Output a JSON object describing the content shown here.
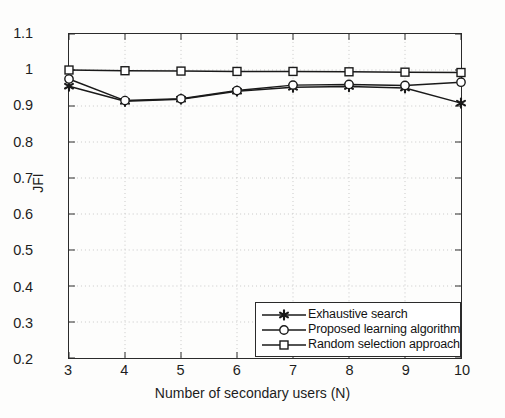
{
  "chart_data": {
    "type": "line",
    "title": "",
    "xlabel": "Number of secondary users (N)",
    "ylabel": "JFI",
    "x": [
      3,
      4,
      5,
      6,
      7,
      8,
      9,
      10
    ],
    "xlim": [
      3,
      10
    ],
    "ylim": [
      0.2,
      1.1
    ],
    "xticks": [
      "3",
      "4",
      "5",
      "6",
      "7",
      "8",
      "9",
      "10"
    ],
    "yticks": [
      "0.2",
      "0.3",
      "0.4",
      "0.5",
      "0.6",
      "0.7",
      "0.8",
      "0.9",
      "1",
      "1.1"
    ],
    "grid": true,
    "grid_style": "dotted",
    "legend_position": "lower right",
    "series": [
      {
        "name": "Exhaustive search",
        "marker": "star",
        "color": "#1a1a1a",
        "values": [
          0.955,
          0.913,
          0.919,
          0.941,
          0.952,
          0.954,
          0.95,
          0.908
        ]
      },
      {
        "name": "Proposed learning algorithm",
        "marker": "circle",
        "color": "#1a1a1a",
        "values": [
          0.975,
          0.915,
          0.92,
          0.943,
          0.958,
          0.96,
          0.957,
          0.966
        ]
      },
      {
        "name": "Random selection approach",
        "marker": "square",
        "color": "#1a1a1a",
        "values": [
          1.0,
          0.998,
          0.997,
          0.996,
          0.996,
          0.995,
          0.994,
          0.993
        ]
      }
    ]
  },
  "axes": {
    "line_color": "#2b2b2b",
    "grid_color": "#c8c8c8",
    "background": "#fdfdfc"
  }
}
